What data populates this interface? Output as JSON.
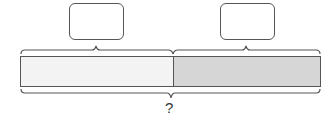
{
  "diagram": {
    "type": "tape-diagram",
    "part_boxes": [
      {
        "label": "",
        "fill": "#ffffff"
      },
      {
        "label": "",
        "fill": "#ffffff"
      }
    ],
    "segments": [
      {
        "name": "part-1",
        "fill": "#f3f3f3"
      },
      {
        "name": "part-2",
        "fill": "#d6d6d6"
      }
    ],
    "total_label": "?",
    "stroke_color": "#555555"
  }
}
